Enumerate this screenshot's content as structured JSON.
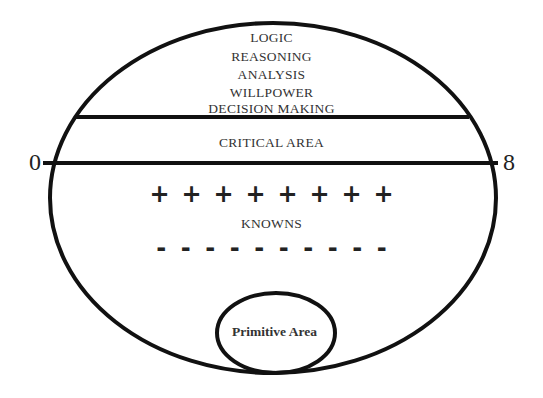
{
  "diagram": {
    "upper_labels": [
      "LOGIC",
      "REASONING",
      "ANALYSIS",
      "WILLPOWER",
      "DECISION MAKING"
    ],
    "critical_label": "CRITICAL AREA",
    "axis": {
      "start": "0",
      "end": "8"
    },
    "knowns_label": "KNOWNS",
    "plus_signs": [
      "+",
      "+",
      "+",
      "+",
      "+",
      "+",
      "+",
      "+"
    ],
    "minus_signs": [
      "-",
      "-",
      "-",
      "-",
      "-",
      "-",
      "-",
      "-",
      "-",
      "-"
    ],
    "primitive_label": "Primitive Area"
  }
}
